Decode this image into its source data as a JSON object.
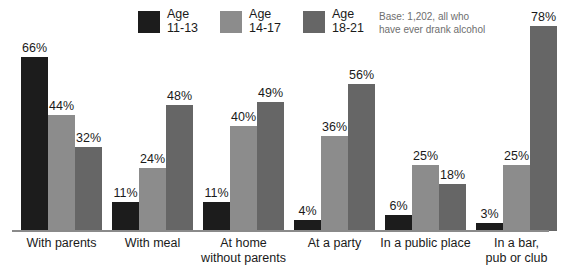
{
  "legend": {
    "entries": [
      {
        "label_line1": "Age",
        "label_line2": "11-13",
        "color": "#1c1c1c"
      },
      {
        "label_line1": "Age",
        "label_line2": "14-17",
        "color": "#8c8c8c"
      },
      {
        "label_line1": "Age",
        "label_line2": "18-21",
        "color": "#666666"
      }
    ]
  },
  "base_note": {
    "line1": "Base: 1,202, all who",
    "line2": "have ever drank alcohol"
  },
  "chart_data": {
    "type": "bar",
    "title": "",
    "subtitle": "",
    "xlabel": "",
    "ylabel": "",
    "ylim": [
      0,
      100
    ],
    "grid": false,
    "legend_position": "top",
    "value_suffix": "%",
    "categories": [
      "With parents",
      "With meal",
      "At home without parents",
      "At a party",
      "In a public place",
      "In a bar, pub or club"
    ],
    "category_lines": [
      [
        "With parents"
      ],
      [
        "With meal"
      ],
      [
        "At home",
        "without parents"
      ],
      [
        "At a party"
      ],
      [
        "In a public place"
      ],
      [
        "In a bar,",
        "pub or club"
      ]
    ],
    "series": [
      {
        "name": "Age 11-13",
        "color": "#1c1c1c",
        "values": [
          66,
          11,
          11,
          4,
          6,
          3
        ],
        "labels": [
          "66%",
          "11%",
          "11%",
          "4%",
          "6%",
          "3%"
        ]
      },
      {
        "name": "Age 14-17",
        "color": "#8c8c8c",
        "values": [
          44,
          24,
          40,
          36,
          25,
          25
        ],
        "labels": [
          "44%",
          "24%",
          "40%",
          "36%",
          "25%",
          "25%"
        ]
      },
      {
        "name": "Age 18-21",
        "color": "#666666",
        "values": [
          32,
          48,
          49,
          56,
          18,
          78
        ],
        "labels": [
          "32%",
          "48%",
          "49%",
          "56%",
          "18%",
          "78%"
        ]
      }
    ]
  }
}
